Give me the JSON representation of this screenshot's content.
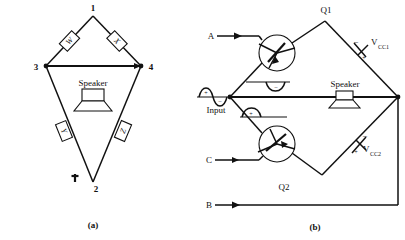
{
  "figure": {
    "panels": [
      {
        "caption": "(a)",
        "title": "bridge-amplifier-speaker-circuit",
        "nodes": [
          {
            "id": "node-1",
            "label": "1"
          },
          {
            "id": "node-2",
            "label": "2"
          },
          {
            "id": "node-3",
            "label": "3"
          },
          {
            "id": "node-4",
            "label": "4"
          }
        ],
        "resistors": [
          {
            "id": "resistor-w",
            "label": "W",
            "position": "upper-left"
          },
          {
            "id": "resistor-x",
            "label": "X",
            "position": "upper-right"
          },
          {
            "id": "resistor-y",
            "label": "Y",
            "position": "lower-left"
          },
          {
            "id": "resistor-z",
            "label": "Z",
            "position": "lower-right"
          }
        ],
        "speaker_label": "Speaker",
        "ground_symbol": "ground"
      },
      {
        "caption": "(b)",
        "title": "push-pull-transistor-bridge-circuit",
        "transistors": [
          {
            "id": "transistor-q1",
            "label": "Q1",
            "position": "upper-left"
          },
          {
            "id": "transistor-q2",
            "label": "Q2",
            "position": "lower-left"
          }
        ],
        "terminals": [
          {
            "id": "terminal-a",
            "label": "A"
          },
          {
            "id": "terminal-c",
            "label": "C"
          },
          {
            "id": "terminal-b",
            "label": "B"
          }
        ],
        "sources": [
          {
            "id": "source-vcc1",
            "label": "V",
            "subscript": "CC1",
            "minus": "–",
            "plus": "+"
          },
          {
            "id": "source-vcc2",
            "label": "V",
            "subscript": "CC2",
            "minus": "–",
            "plus": "+"
          }
        ],
        "speaker_label": "Speaker",
        "input_label": "Input",
        "waveforms": [
          {
            "id": "waveform-input",
            "positive_sign": "+",
            "negative_sign": "–"
          },
          {
            "id": "waveform-upper-branch",
            "sign": "–",
            "polarity": "negative-half-cycle"
          },
          {
            "id": "waveform-lower-branch",
            "sign": "+",
            "polarity": "positive-half-cycle"
          }
        ]
      }
    ]
  },
  "colors": {
    "ink": "#111111",
    "paper": "#ffffff"
  }
}
